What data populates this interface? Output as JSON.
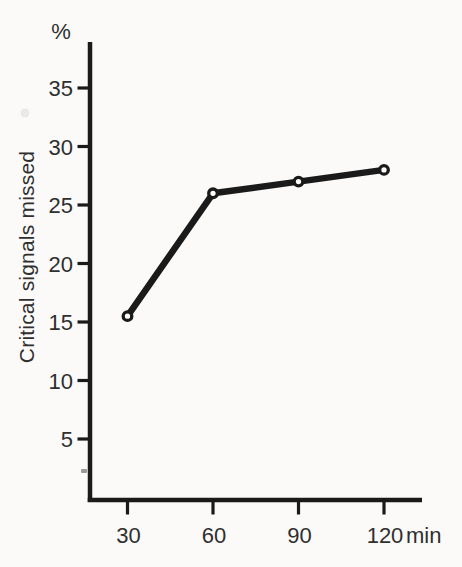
{
  "chart_data": {
    "type": "line",
    "title": "",
    "percent_label": "%",
    "ylabel": "Critical signals missed",
    "xlabel": "",
    "x_unit": "min",
    "x": [
      30,
      60,
      90,
      120
    ],
    "x_tick_labels": [
      "30",
      "60",
      "90",
      "120"
    ],
    "y_ticks": [
      5,
      10,
      15,
      20,
      25,
      30,
      35
    ],
    "y_tick_labels": [
      "5",
      "10",
      "15",
      "20",
      "25",
      "30",
      "35"
    ],
    "series": [
      {
        "name": "Critical signals missed",
        "values": [
          15.5,
          26,
          27,
          28
        ]
      }
    ],
    "ylim": [
      0,
      39
    ],
    "xlim": [
      17,
      133
    ],
    "grid": false,
    "legend": false,
    "marker": "open-circle",
    "ink_color": "#1a1a1a",
    "text_color": "#2f2f2f",
    "background_color": "#fbfaf8",
    "marker_fill": "#fdfdfc"
  }
}
